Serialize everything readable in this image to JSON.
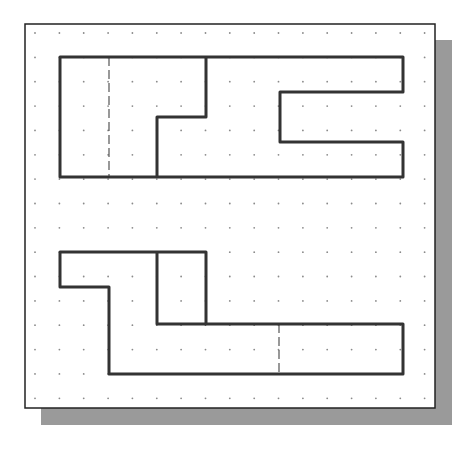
{
  "figure": {
    "colors": {
      "background": "#ffffff",
      "sheet_fill": "#ffffff",
      "sheet_border": "#222222",
      "shadow": "#9a9a9a",
      "grid_dot": "#8a8a8a",
      "outline": "#333333",
      "hidden_line": "#555555"
    },
    "sheet": {
      "x": 25,
      "y": 24,
      "width": 410,
      "height": 384,
      "shadow_offset": 16
    },
    "grid": {
      "x0": 35,
      "y0": 33,
      "spacing": 24.35,
      "cols": 17,
      "rows": 16
    },
    "views": [
      {
        "name": "top-view",
        "outline": [
          [
            60,
            57
          ],
          [
            403,
            57
          ],
          [
            403,
            92
          ],
          [
            280,
            92
          ],
          [
            280,
            142
          ],
          [
            403,
            142
          ],
          [
            403,
            177
          ],
          [
            60,
            177
          ]
        ],
        "inner_lines": [
          {
            "type": "solid",
            "points": [
              [
                206,
                57
              ],
              [
                206,
                117
              ],
              [
                157,
                117
              ],
              [
                157,
                177
              ]
            ]
          }
        ],
        "hidden_lines": [
          {
            "points": [
              [
                109,
                57
              ],
              [
                109,
                177
              ]
            ]
          }
        ]
      },
      {
        "name": "front-view",
        "outline": [
          [
            60,
            252
          ],
          [
            206,
            252
          ],
          [
            206,
            324
          ],
          [
            403,
            324
          ],
          [
            403,
            374
          ],
          [
            109,
            374
          ],
          [
            109,
            287
          ],
          [
            60,
            287
          ]
        ],
        "inner_lines": [
          {
            "type": "solid",
            "points": [
              [
                157,
                252
              ],
              [
                157,
                324
              ],
              [
                206,
                324
              ]
            ]
          }
        ],
        "hidden_lines": [
          {
            "points": [
              [
                279,
                324
              ],
              [
                279,
                374
              ]
            ]
          }
        ]
      }
    ]
  }
}
